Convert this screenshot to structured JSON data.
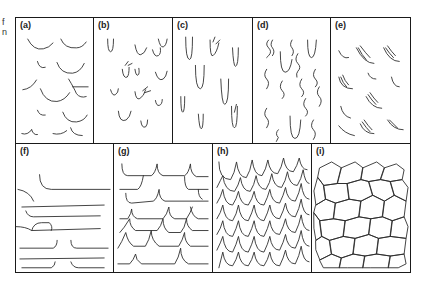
{
  "margin_fragments": [
    "f",
    "n"
  ],
  "figure": {
    "stroke_color": "#2b2b2b",
    "border_color": "#1a1a1a",
    "panels": [
      {
        "id": "a",
        "label": "(a)"
      },
      {
        "id": "b",
        "label": "(b)"
      },
      {
        "id": "c",
        "label": "(c)"
      },
      {
        "id": "d",
        "label": "(d)"
      },
      {
        "id": "e",
        "label": "(e)"
      },
      {
        "id": "f",
        "label": "(f)"
      },
      {
        "id": "g",
        "label": "(g)"
      },
      {
        "id": "h",
        "label": "(h)"
      },
      {
        "id": "i",
        "label": "(i)"
      }
    ]
  }
}
